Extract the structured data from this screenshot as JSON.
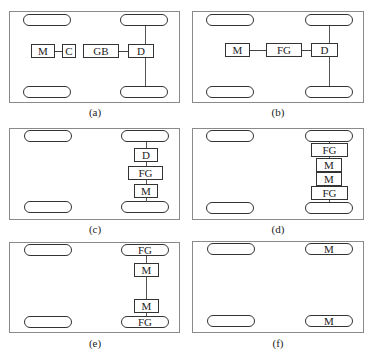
{
  "panels": [
    {
      "id": "a",
      "caption": "(a)",
      "components": [
        "M",
        "C",
        "GB",
        "D"
      ],
      "layout": "central motor + clutch + gearbox + differential to rear axle"
    },
    {
      "id": "b",
      "caption": "(b)",
      "components": [
        "M",
        "FG",
        "D"
      ],
      "layout": "central motor + fixed gear + differential to rear axle"
    },
    {
      "id": "c",
      "caption": "(c)",
      "components": [
        "D",
        "FG",
        "M"
      ],
      "layout": "motor, fixed gear, differential stacked on rear axle"
    },
    {
      "id": "d",
      "caption": "(d)",
      "components": [
        "FG",
        "M",
        "M",
        "FG"
      ],
      "layout": "dual motors each with fixed gear on rear axle"
    },
    {
      "id": "e",
      "caption": "(e)",
      "components": [
        "FG",
        "M",
        "M",
        "FG"
      ],
      "layout": "dual motors with in-wheel fixed gears"
    },
    {
      "id": "f",
      "caption": "(f)",
      "components": [
        "M",
        "M"
      ],
      "layout": "in-wheel motors"
    }
  ],
  "labels": {
    "motor": "M",
    "clutch": "C",
    "gearbox": "GB",
    "differential": "D",
    "fixed_gear": "FG"
  }
}
